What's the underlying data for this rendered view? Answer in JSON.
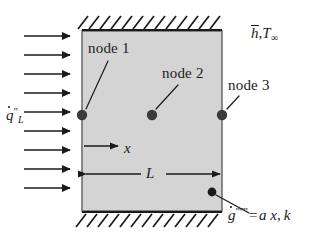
{
  "figure": {
    "domain": "engineering-heat-transfer-diagram",
    "background_color": "#ffffff",
    "line_color": "#1a1a1a",
    "wall": {
      "fill_color": "#d4d4d4",
      "border_color": "#6e6e6e",
      "x": 82,
      "y": 31,
      "width": 140,
      "height": 180
    },
    "hatching": {
      "top_label": "adiabatic-hatch-top",
      "bottom_label": "adiabatic-hatch-bottom",
      "stroke_count": 13,
      "angle_deg": 55
    },
    "labels": {
      "heat_flux": {
        "symbol": "q",
        "accent": "dot",
        "primes": "\"",
        "subscript": "L",
        "plain": "q̇\"_L"
      },
      "convection": {
        "h_symbol": "h",
        "h_accent": "overbar",
        "separator": ",",
        "t_symbol": "T",
        "t_subscript": "∞",
        "plain": "h̄, T∞"
      },
      "node1": "node 1",
      "node2": "node 2",
      "node3": "node 3",
      "axis_x": "x",
      "dimension_L": "L",
      "generation": {
        "symbol": "g",
        "accent": "dot",
        "primes": "\"\"\"",
        "equals": "=",
        "expression": "a x",
        "separator": ",",
        "conductivity": "k",
        "plain": "ġ''' = a x, k"
      }
    },
    "nodes": [
      {
        "name": "node-1",
        "x": 82,
        "y": 115,
        "radius": 5
      },
      {
        "name": "node-2",
        "x": 152,
        "y": 115,
        "radius": 5
      },
      {
        "name": "node-3",
        "x": 222,
        "y": 115,
        "radius": 5
      }
    ],
    "generation_point": {
      "name": "generation-point",
      "x": 212,
      "y": 192,
      "radius": 4
    },
    "flux_arrows": {
      "count": 9,
      "direction": "right",
      "x_start": 24,
      "x_end": 72,
      "y_positions": [
        36,
        55,
        74,
        93,
        112,
        131,
        150,
        169,
        188
      ]
    },
    "leader_lines": [
      {
        "name": "leader-node-1",
        "x1": 108,
        "y1": 62,
        "x2": 86,
        "y2": 110
      },
      {
        "name": "leader-node-2",
        "x1": 176,
        "y1": 86,
        "x2": 156,
        "y2": 110
      },
      {
        "name": "leader-node-3",
        "x1": 238,
        "y1": 98,
        "x2": 226,
        "y2": 110
      },
      {
        "name": "leader-generation",
        "x1": 216,
        "y1": 195,
        "x2": 248,
        "y2": 212
      }
    ],
    "x_axis_arrow": {
      "x1": 84,
      "y1": 146,
      "x2": 120,
      "y2": 146
    },
    "dimension_L_arrow": {
      "x1": 84,
      "y1": 174,
      "x2": 221,
      "y2": 174
    }
  }
}
